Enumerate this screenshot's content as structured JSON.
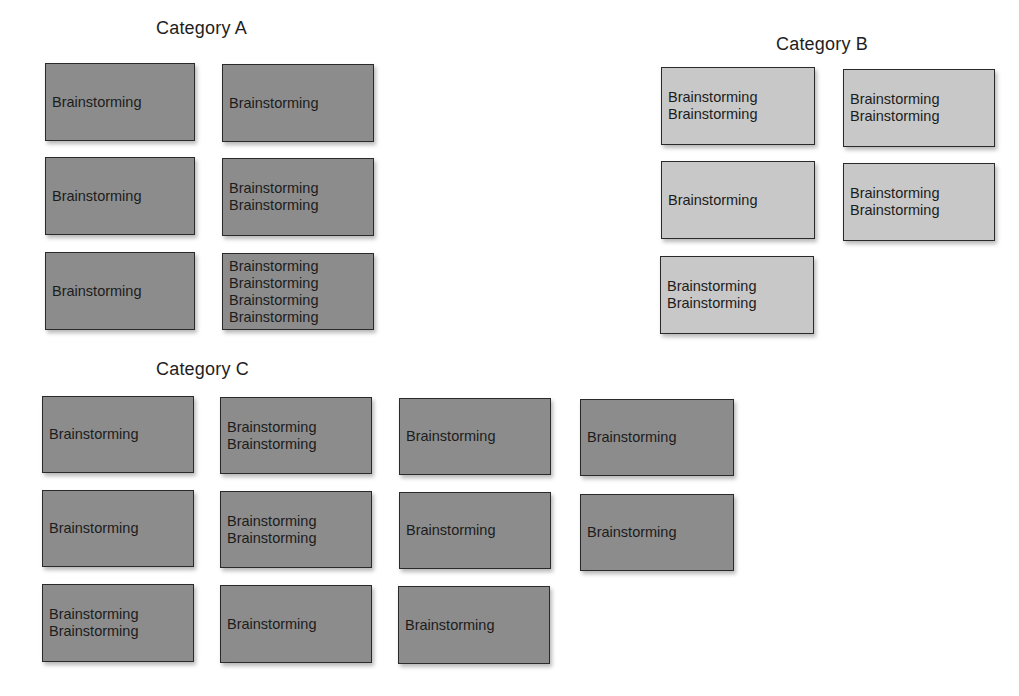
{
  "categories": [
    {
      "title": "Category A",
      "shade": "dark",
      "title_pos": [
        156,
        18
      ],
      "cards": [
        {
          "x": 45,
          "y": 63,
          "w": 150,
          "h": 78,
          "lines": [
            "Brainstorming"
          ]
        },
        {
          "x": 222,
          "y": 64,
          "w": 152,
          "h": 78,
          "lines": [
            "Brainstorming"
          ]
        },
        {
          "x": 45,
          "y": 157,
          "w": 150,
          "h": 78,
          "lines": [
            "Brainstorming"
          ]
        },
        {
          "x": 222,
          "y": 158,
          "w": 152,
          "h": 78,
          "lines": [
            "Brainstorming",
            "Brainstorming"
          ]
        },
        {
          "x": 45,
          "y": 252,
          "w": 150,
          "h": 78,
          "lines": [
            "Brainstorming"
          ]
        },
        {
          "x": 222,
          "y": 253,
          "w": 152,
          "h": 77,
          "lines": [
            "Brainstorming",
            "Brainstorming",
            "Brainstorming",
            "Brainstorming"
          ]
        }
      ]
    },
    {
      "title": "Category B",
      "shade": "light",
      "title_pos": [
        776,
        34
      ],
      "cards": [
        {
          "x": 661,
          "y": 67,
          "w": 154,
          "h": 78,
          "lines": [
            "Brainstorming",
            "Brainstorming"
          ]
        },
        {
          "x": 843,
          "y": 69,
          "w": 152,
          "h": 78,
          "lines": [
            "Brainstorming",
            "Brainstorming"
          ]
        },
        {
          "x": 661,
          "y": 161,
          "w": 154,
          "h": 78,
          "lines": [
            "Brainstorming"
          ]
        },
        {
          "x": 843,
          "y": 163,
          "w": 152,
          "h": 78,
          "lines": [
            "Brainstorming",
            "Brainstorming"
          ]
        },
        {
          "x": 660,
          "y": 256,
          "w": 154,
          "h": 78,
          "lines": [
            "Brainstorming",
            "Brainstorming"
          ]
        }
      ]
    },
    {
      "title": "Category C",
      "shade": "dark",
      "title_pos": [
        156,
        359
      ],
      "cards": [
        {
          "x": 42,
          "y": 396,
          "w": 152,
          "h": 77,
          "lines": [
            "Brainstorming"
          ]
        },
        {
          "x": 220,
          "y": 397,
          "w": 152,
          "h": 77,
          "lines": [
            "Brainstorming",
            "Brainstorming"
          ]
        },
        {
          "x": 399,
          "y": 398,
          "w": 152,
          "h": 77,
          "lines": [
            "Brainstorming"
          ]
        },
        {
          "x": 580,
          "y": 399,
          "w": 154,
          "h": 77,
          "lines": [
            "Brainstorming"
          ]
        },
        {
          "x": 42,
          "y": 490,
          "w": 152,
          "h": 77,
          "lines": [
            "Brainstorming"
          ]
        },
        {
          "x": 220,
          "y": 491,
          "w": 152,
          "h": 77,
          "lines": [
            "Brainstorming",
            "Brainstorming"
          ]
        },
        {
          "x": 399,
          "y": 492,
          "w": 152,
          "h": 77,
          "lines": [
            "Brainstorming"
          ]
        },
        {
          "x": 580,
          "y": 494,
          "w": 154,
          "h": 77,
          "lines": [
            "Brainstorming"
          ]
        },
        {
          "x": 42,
          "y": 584,
          "w": 152,
          "h": 78,
          "lines": [
            "Brainstorming",
            "Brainstorming"
          ]
        },
        {
          "x": 220,
          "y": 585,
          "w": 152,
          "h": 78,
          "lines": [
            "Brainstorming"
          ]
        },
        {
          "x": 398,
          "y": 586,
          "w": 152,
          "h": 78,
          "lines": [
            "Brainstorming"
          ]
        }
      ]
    }
  ],
  "colors": {
    "dark_card": "#8c8c8c",
    "light_card": "#c8c8c8",
    "border": "#2a2a2a",
    "text": "#1c1c1c"
  }
}
